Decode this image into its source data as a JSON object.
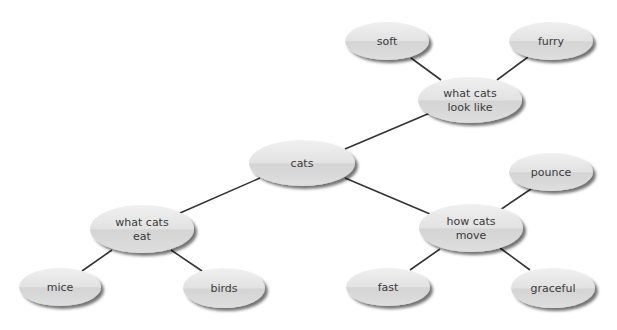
{
  "diagram": {
    "type": "concept-map",
    "colors": {
      "node_fill": "#dcdcdc",
      "node_highlight": "#ececec",
      "node_shadow": "#9a9a9a",
      "edge": "#333333",
      "text": "#3a3a3a"
    },
    "nodes": [
      {
        "id": "cats",
        "lines": [
          "cats"
        ],
        "cx": 302,
        "cy": 163,
        "rx": 53,
        "ry": 23
      },
      {
        "id": "look",
        "lines": [
          "what cats",
          "look like"
        ],
        "cx": 470,
        "cy": 100,
        "rx": 52,
        "ry": 23
      },
      {
        "id": "soft",
        "lines": [
          "soft"
        ],
        "cx": 387,
        "cy": 41,
        "rx": 42,
        "ry": 19
      },
      {
        "id": "furry",
        "lines": [
          "furry"
        ],
        "cx": 551,
        "cy": 41,
        "rx": 42,
        "ry": 19
      },
      {
        "id": "move",
        "lines": [
          "how cats",
          "move"
        ],
        "cx": 471,
        "cy": 228,
        "rx": 52,
        "ry": 24
      },
      {
        "id": "pounce",
        "lines": [
          "pounce"
        ],
        "cx": 551,
        "cy": 172,
        "rx": 42,
        "ry": 19
      },
      {
        "id": "fast",
        "lines": [
          "fast"
        ],
        "cx": 388,
        "cy": 287,
        "rx": 42,
        "ry": 19
      },
      {
        "id": "graceful",
        "lines": [
          "graceful"
        ],
        "cx": 553,
        "cy": 288,
        "rx": 42,
        "ry": 20
      },
      {
        "id": "eat",
        "lines": [
          "what cats",
          "eat"
        ],
        "cx": 142,
        "cy": 229,
        "rx": 52,
        "ry": 24
      },
      {
        "id": "mice",
        "lines": [
          "mice"
        ],
        "cx": 60,
        "cy": 287,
        "rx": 41,
        "ry": 19
      },
      {
        "id": "birds",
        "lines": [
          "birds"
        ],
        "cx": 224,
        "cy": 288,
        "rx": 41,
        "ry": 20
      }
    ],
    "edges": [
      {
        "from": "cats",
        "to": "look",
        "x1": 345,
        "y1": 149,
        "x2": 430,
        "y2": 113
      },
      {
        "from": "look",
        "to": "soft",
        "x1": 441,
        "y1": 80,
        "x2": 411,
        "y2": 58
      },
      {
        "from": "look",
        "to": "furry",
        "x1": 497,
        "y1": 80,
        "x2": 528,
        "y2": 57
      },
      {
        "from": "cats",
        "to": "move",
        "x1": 345,
        "y1": 178,
        "x2": 430,
        "y2": 214
      },
      {
        "from": "move",
        "to": "pounce",
        "x1": 500,
        "y1": 210,
        "x2": 531,
        "y2": 189
      },
      {
        "from": "move",
        "to": "fast",
        "x1": 440,
        "y1": 249,
        "x2": 410,
        "y2": 270
      },
      {
        "from": "move",
        "to": "graceful",
        "x1": 500,
        "y1": 248,
        "x2": 530,
        "y2": 270
      },
      {
        "from": "cats",
        "to": "eat",
        "x1": 260,
        "y1": 178,
        "x2": 180,
        "y2": 213
      },
      {
        "from": "eat",
        "to": "mice",
        "x1": 112,
        "y1": 250,
        "x2": 82,
        "y2": 271
      },
      {
        "from": "eat",
        "to": "birds",
        "x1": 171,
        "y1": 250,
        "x2": 202,
        "y2": 271
      }
    ]
  }
}
